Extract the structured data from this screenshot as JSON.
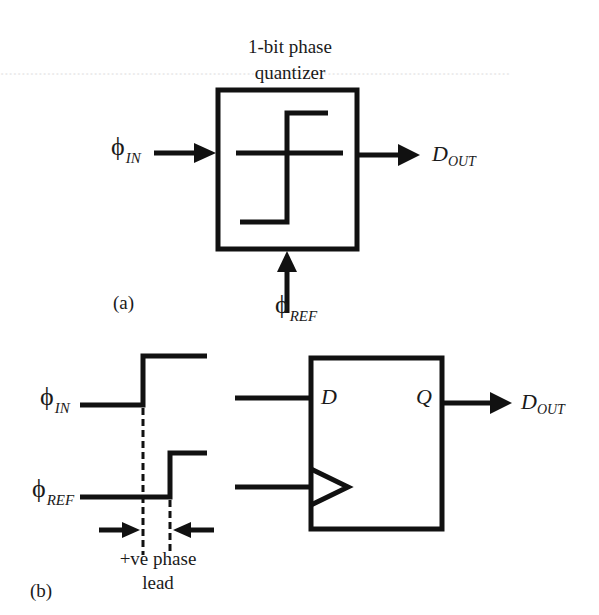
{
  "figure_a": {
    "title_line1": "1-bit phase",
    "title_line2": "quantizer",
    "input_symbol": "ϕ",
    "input_sub": "IN",
    "ref_symbol": "ϕ",
    "ref_sub": "REF",
    "output_main": "D",
    "output_sub": "OUT",
    "caption": "(a)"
  },
  "figure_b": {
    "in_symbol": "ϕ",
    "in_sub": "IN",
    "ref_symbol": "ϕ",
    "ref_sub": "REF",
    "ff_d_label": "D",
    "ff_q_label": "Q",
    "output_main": "D",
    "output_sub": "OUT",
    "lead_line1": "+ve phase",
    "lead_line2": "lead",
    "caption": "(b)"
  },
  "colors": {
    "stroke": "#111111",
    "background": "#ffffff",
    "bleed_text": "#ebebeb"
  }
}
